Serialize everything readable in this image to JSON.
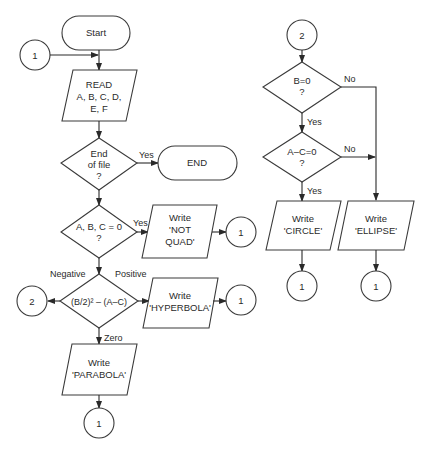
{
  "diagram": {
    "type": "flowchart",
    "nodes": {
      "start": {
        "kind": "terminal",
        "text": [
          "Start"
        ]
      },
      "conn1_in": {
        "kind": "connector",
        "text": [
          "1"
        ]
      },
      "read": {
        "kind": "io",
        "text": [
          "READ",
          "A, B, C, D,",
          "E, F"
        ]
      },
      "eof": {
        "kind": "decision",
        "text": [
          "End",
          "of file",
          "?"
        ]
      },
      "end": {
        "kind": "terminal",
        "text": [
          "END"
        ]
      },
      "abc0": {
        "kind": "decision",
        "text": [
          "A, B, C = 0",
          "?"
        ]
      },
      "notquad": {
        "kind": "io",
        "text": [
          "Write",
          "'NOT",
          "QUAD'"
        ]
      },
      "conn1_a": {
        "kind": "connector",
        "text": [
          "1"
        ]
      },
      "disc": {
        "kind": "decision",
        "text": [
          "(B/2)² – (A–C)"
        ]
      },
      "conn2_out": {
        "kind": "connector",
        "text": [
          "2"
        ]
      },
      "hyperbola": {
        "kind": "io",
        "text": [
          "Write",
          "'HYPERBOLA'"
        ]
      },
      "conn1_b": {
        "kind": "connector",
        "text": [
          "1"
        ]
      },
      "parabola": {
        "kind": "io",
        "text": [
          "Write",
          "'PARABOLA'"
        ]
      },
      "conn1_c": {
        "kind": "connector",
        "text": [
          "1"
        ]
      },
      "conn2_in": {
        "kind": "connector",
        "text": [
          "2"
        ]
      },
      "b0": {
        "kind": "decision",
        "text": [
          "B=0",
          "?"
        ]
      },
      "ac0": {
        "kind": "decision",
        "text": [
          "A–C=0",
          "?"
        ]
      },
      "circle": {
        "kind": "io",
        "text": [
          "Write",
          "'CIRCLE'"
        ]
      },
      "ellipse": {
        "kind": "io",
        "text": [
          "Write",
          "'ELLIPSE'"
        ]
      },
      "conn1_d": {
        "kind": "connector",
        "text": [
          "1"
        ]
      },
      "conn1_e": {
        "kind": "connector",
        "text": [
          "1"
        ]
      }
    },
    "edge_labels": {
      "eof_yes": "Yes",
      "abc0_yes": "Yes",
      "disc_negative": "Negative",
      "disc_positive": "Positive",
      "disc_zero": "Zero",
      "b0_no": "No",
      "b0_yes": "Yes",
      "ac0_no": "No",
      "ac0_yes": "Yes"
    },
    "colors": {
      "stroke": "#2a2a2a",
      "background": "#ffffff"
    }
  }
}
